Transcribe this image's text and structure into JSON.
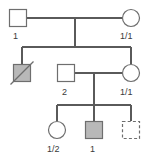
{
  "chart_data": {
    "type": "diagram",
    "diagram_kind": "pedigree",
    "title": "",
    "colors": {
      "line": "#5a5a5a",
      "symbol_stroke": "#6e6e6e",
      "symbol_unaffected_fill": "#ffffff",
      "symbol_affected_fill": "#b8b8b8",
      "label_text": "#3a3a3a",
      "background": "#ffffff"
    },
    "legend_notes": {
      "square": "male",
      "circle": "female",
      "shaded": "affected",
      "diagonal_slash": "deceased",
      "dashed_outline": "unknown or pregnancy"
    },
    "generations": [
      {
        "generation": 1,
        "y": 18,
        "individuals": [
          {
            "id": "I-1",
            "sex": "male",
            "shape": "square",
            "x": 18,
            "y": 18,
            "size": 17,
            "affected": false,
            "deceased": false,
            "dashed": false,
            "label": "1",
            "label_x": 13,
            "label_y": 32
          },
          {
            "id": "I-2",
            "sex": "female",
            "shape": "circle",
            "x": 131,
            "y": 18,
            "size": 17,
            "affected": false,
            "deceased": false,
            "dashed": false,
            "label": "1/1",
            "label_x": 120,
            "label_y": 32
          }
        ]
      },
      {
        "generation": 2,
        "y": 73,
        "individuals": [
          {
            "id": "II-1",
            "sex": "male",
            "shape": "square",
            "x": 22,
            "y": 73,
            "size": 17,
            "affected": true,
            "deceased": true,
            "dashed": false,
            "label": "",
            "label_x": 0,
            "label_y": 0
          },
          {
            "id": "II-2",
            "sex": "male",
            "shape": "square",
            "x": 66,
            "y": 73,
            "size": 17,
            "affected": false,
            "deceased": false,
            "dashed": false,
            "label": "2",
            "label_x": 62,
            "label_y": 88
          },
          {
            "id": "II-3",
            "sex": "female",
            "shape": "circle",
            "x": 131,
            "y": 73,
            "size": 17,
            "affected": false,
            "deceased": false,
            "dashed": false,
            "label": "1/1",
            "label_x": 120,
            "label_y": 88
          }
        ]
      },
      {
        "generation": 3,
        "y": 130,
        "individuals": [
          {
            "id": "III-1",
            "sex": "female",
            "shape": "circle",
            "x": 57,
            "y": 130,
            "size": 17,
            "affected": false,
            "deceased": false,
            "dashed": false,
            "label": "1/2",
            "label_x": 47,
            "label_y": 145
          },
          {
            "id": "III-2",
            "sex": "male",
            "shape": "square",
            "x": 94,
            "y": 130,
            "size": 17,
            "affected": true,
            "deceased": false,
            "dashed": false,
            "label": "1",
            "label_x": 90,
            "label_y": 145
          },
          {
            "id": "III-3",
            "sex": "male",
            "shape": "square",
            "x": 131,
            "y": 130,
            "size": 17,
            "affected": false,
            "deceased": false,
            "dashed": true,
            "label": "",
            "label_x": 0,
            "label_y": 0
          }
        ]
      }
    ],
    "matings": [
      {
        "id": "mating-1",
        "partner_a": "I-1",
        "partner_b": "I-2",
        "line_y": 18,
        "x_from": 27,
        "x_to": 122,
        "drop_x": 75,
        "drop_to_y": 47
      },
      {
        "id": "mating-2",
        "partner_a": "II-2",
        "partner_b": "II-3",
        "line_y": 73,
        "x_from": 75,
        "x_to": 122,
        "drop_x": 94,
        "drop_to_y": 105
      }
    ],
    "sibships": [
      {
        "id": "sibship-1",
        "from_mating": "mating-1",
        "line_y": 47,
        "x_from": 22,
        "x_to": 131,
        "children": [
          "II-1",
          "II-3"
        ],
        "child_drop_xs": [
          22,
          131
        ],
        "child_drop_to_y": 64
      },
      {
        "id": "sibship-2",
        "from_mating": "mating-2",
        "line_y": 105,
        "x_from": 57,
        "x_to": 131,
        "children": [
          "III-1",
          "III-2",
          "III-3"
        ],
        "child_drop_xs": [
          57,
          94,
          131
        ],
        "child_drop_to_y": 121
      }
    ],
    "labels": [
      {
        "text": "1",
        "x": 13,
        "y": 32,
        "for": "I-1"
      },
      {
        "text": "1/1",
        "x": 120,
        "y": 32,
        "for": "I-2"
      },
      {
        "text": "2",
        "x": 62,
        "y": 88,
        "for": "II-2"
      },
      {
        "text": "1/1",
        "x": 120,
        "y": 88,
        "for": "II-3"
      },
      {
        "text": "1/2",
        "x": 47,
        "y": 145,
        "for": "III-1"
      },
      {
        "text": "1",
        "x": 90,
        "y": 145,
        "for": "III-2"
      }
    ]
  }
}
